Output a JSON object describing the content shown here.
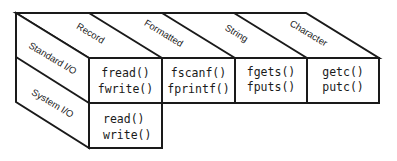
{
  "diagram": {
    "title": "",
    "colors": {
      "stroke": "#1a1a1a",
      "background": "#ffffff"
    },
    "columns": [
      {
        "id": "record",
        "label": "Record"
      },
      {
        "id": "formatted",
        "label": "Formatted"
      },
      {
        "id": "string",
        "label": "String"
      },
      {
        "id": "character",
        "label": "Character"
      }
    ],
    "rows": [
      {
        "id": "standard",
        "label": "Standard I/O"
      },
      {
        "id": "system",
        "label": "System I/O"
      }
    ],
    "cells": {
      "standard_record": [
        "fread()",
        "fwrite()"
      ],
      "standard_formatted": [
        "fscanf()",
        "fprintf()"
      ],
      "standard_string": [
        "fgets()",
        "fputs()"
      ],
      "standard_character": [
        "getc()",
        "putc()"
      ],
      "system_record": [
        "read()",
        "write()"
      ]
    }
  }
}
